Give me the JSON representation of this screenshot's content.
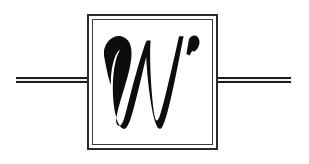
{
  "canvas": {
    "width": 309,
    "height": 164,
    "background_color": "#ffffff"
  },
  "emblem": {
    "type": "logo-mark",
    "description": "Calligraphic letter W inside a double-ruled square frame with horizontal double rules extending to left and right",
    "letter": "W",
    "letter_style": "calligraphic-italic-swash",
    "letter_color": "#0d0d0d",
    "frame": {
      "outer_border_color": "#2a2a2e",
      "outer_border_width_px": 2,
      "inner_border_color": "#3a3a40",
      "inner_border_width_px": 1,
      "gap_px": 3,
      "fill_color": "#ffffff",
      "x": 87,
      "y": 14,
      "width": 131,
      "height": 136
    },
    "rules": {
      "color": "#1c1c1c",
      "inner_fill": "#f2f2f2",
      "stroke_width_px": 2,
      "center_y": 80,
      "left": {
        "x_start": 16,
        "x_end": 88
      },
      "right": {
        "x_start": 217,
        "x_end": 291
      }
    }
  }
}
